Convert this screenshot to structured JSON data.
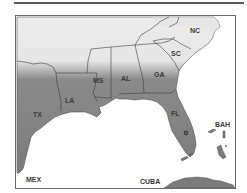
{
  "map": {
    "title": "",
    "colors": {
      "land_shaded": "#7f7f7f",
      "land_light": "#ebebeb",
      "water": "#ffffff",
      "border": "#3c3c3c",
      "frame": "#6a6a6a"
    },
    "states": [
      {
        "code": "NC",
        "label": "NC"
      },
      {
        "code": "SC",
        "label": "SC"
      },
      {
        "code": "GA",
        "label": "GA"
      },
      {
        "code": "AL",
        "label": "AL"
      },
      {
        "code": "MS",
        "label": "MS"
      },
      {
        "code": "LA",
        "label": "LA"
      },
      {
        "code": "TX",
        "label": "TX"
      },
      {
        "code": "FL",
        "label": "FL"
      }
    ],
    "countries": [
      {
        "code": "MEX",
        "label": "MEX"
      },
      {
        "code": "CUBA",
        "label": "CUBA"
      },
      {
        "code": "BAH",
        "label": "BAH"
      }
    ],
    "marker": {
      "symbol": "circle",
      "state": "FL"
    }
  }
}
